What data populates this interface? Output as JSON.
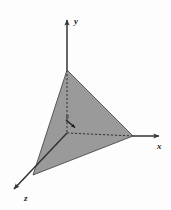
{
  "figure": {
    "title": "",
    "type": "3d-coordinate-axes-with-shaded-triangle",
    "background_color": "#fdfdfd",
    "axes": [
      {
        "id": "x",
        "label": "x",
        "label_x": 157,
        "label_y": 149,
        "from": [
          67,
          133
        ],
        "to": [
          163,
          136
        ],
        "direction": "right",
        "arrow": true,
        "color": "#333333"
      },
      {
        "id": "y",
        "label": "y",
        "label_x": 74,
        "label_y": 24,
        "from": [
          67,
          133
        ],
        "to": [
          67,
          16
        ],
        "direction": "up",
        "arrow": true,
        "color": "#333333"
      },
      {
        "id": "z",
        "label": "z",
        "label_x": 24,
        "label_y": 201,
        "from": [
          67,
          133
        ],
        "to": [
          11,
          192
        ],
        "direction": "down-left",
        "arrow": true,
        "color": "#333333"
      }
    ],
    "triangle": {
      "name": "shaded-plane-triangle",
      "fill_color": "#9a9a9a",
      "stroke_color": "#4a4a4a",
      "vertices": [
        {
          "name": "y-intercept",
          "x": 67,
          "y": 70
        },
        {
          "name": "x-intercept",
          "x": 133,
          "y": 136
        },
        {
          "name": "z-intercept",
          "x": 33,
          "y": 175
        }
      ]
    },
    "dashed_lines": [
      {
        "name": "y-axis-hidden-segment",
        "from": [
          67,
          70
        ],
        "to": [
          67,
          133
        ],
        "color": "#2f2f2f"
      },
      {
        "name": "x-axis-hidden-segment",
        "from": [
          67,
          133
        ],
        "to": [
          133,
          136
        ],
        "color": "#2f2f2f"
      }
    ],
    "annotation": {
      "name": "normal-vector-a",
      "label": "a",
      "label_x": 68,
      "label_y": 117,
      "arrow_from": [
        66,
        120
      ],
      "arrow_to": [
        77,
        129
      ],
      "color": "#1a1a1a"
    }
  }
}
